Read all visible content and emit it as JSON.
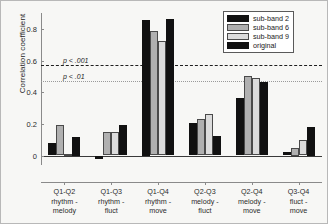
{
  "chart_data": {
    "type": "bar",
    "title": "",
    "xlabel": "",
    "ylabel": "Correlation coefficient",
    "ylim": [
      -0.06,
      0.9
    ],
    "yticks": [
      0,
      0.2,
      0.4,
      0.6,
      0.8
    ],
    "ytick_labels": [
      "0",
      "0.2",
      "0.4",
      "0.6",
      "0.8"
    ],
    "grid": false,
    "legend_position": "top-right",
    "categories": [
      "Q1-Q2\nrhythm -\nmelody",
      "Q1-Q3\nrhythm -\nfluct",
      "Q1-Q4\nrhythm -\nmove",
      "Q2-Q3\nmelody -\nfluct",
      "Q2-Q4\nmelody -\nmove",
      "Q3-Q4\nfluct -\nmove"
    ],
    "category_lines": [
      [
        "Q1-Q2",
        "rhythm -",
        "melody"
      ],
      [
        "Q1-Q3",
        "rhythm -",
        "fluct"
      ],
      [
        "Q1-Q4",
        "rhythm -",
        "move"
      ],
      [
        "Q2-Q3",
        "melody -",
        "fluct"
      ],
      [
        "Q2-Q4",
        "melody -",
        "move"
      ],
      [
        "Q3-Q4",
        "fluct -",
        "move"
      ]
    ],
    "series": [
      {
        "name": "sub-band 2",
        "color": "#111111",
        "values": [
          0.08,
          -0.02,
          0.855,
          0.205,
          0.365,
          0.02
        ]
      },
      {
        "name": "sub-band 6",
        "color": "#b0b0b0",
        "values": [
          0.19,
          0.148,
          0.785,
          0.23,
          0.502,
          0.045
        ]
      },
      {
        "name": "sub-band 9",
        "color": "#dcdcdc",
        "values": [
          0.01,
          0.148,
          0.722,
          0.265,
          0.487,
          0.1
        ]
      },
      {
        "name": "original",
        "color": "#111111",
        "values": [
          0.12,
          0.19,
          0.862,
          0.125,
          0.462,
          0.18
        ]
      }
    ],
    "annotations": [
      {
        "name": "p-001-line",
        "label": "p < .001",
        "value": 0.57,
        "style": "dashed",
        "color": "#1f1f1f"
      },
      {
        "name": "p-01-line",
        "label": "p < .01",
        "value": 0.47,
        "style": "dotted",
        "color": "#9a9a9a"
      }
    ]
  }
}
